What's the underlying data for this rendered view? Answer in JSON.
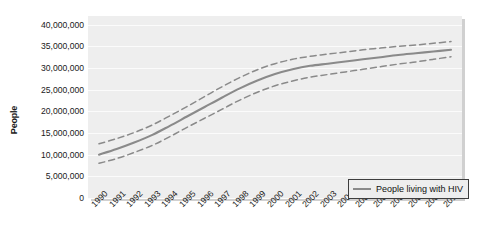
{
  "chart_data": {
    "type": "line",
    "title": "",
    "xlabel": "",
    "ylabel": "People",
    "grid": true,
    "legend_position": "bottom-right",
    "ylim": [
      0,
      42000000
    ],
    "yticks": [
      0,
      5000000,
      10000000,
      15000000,
      20000000,
      25000000,
      30000000,
      35000000,
      40000000
    ],
    "ytick_labels": [
      "0",
      "5,000,000",
      "10,000,000",
      "15,000,000",
      "20,000,000",
      "25,000,000",
      "30,000,000",
      "35,000,000",
      "40,000,000"
    ],
    "categories": [
      "1990",
      "1991",
      "1992",
      "1993",
      "1994",
      "1995",
      "1996",
      "1997",
      "1998",
      "1999",
      "2000",
      "2001",
      "2002",
      "2003",
      "2004",
      "2005",
      "2006",
      "2007",
      "2008",
      "2009",
      "2010"
    ],
    "series": [
      {
        "name": "People living with HIV",
        "style": "solid",
        "color": "#8a8a8a",
        "values": [
          10000000,
          11300000,
          12800000,
          14500000,
          16600000,
          18800000,
          21000000,
          23200000,
          25300000,
          27100000,
          28600000,
          29700000,
          30500000,
          31000000,
          31500000,
          32000000,
          32500000,
          33000000,
          33400000,
          33800000,
          34200000
        ]
      },
      {
        "name": "Upper bound",
        "style": "dashed",
        "color": "#8a8a8a",
        "values": [
          12500000,
          13700000,
          15100000,
          16800000,
          18900000,
          21100000,
          23400000,
          25700000,
          27800000,
          29600000,
          31000000,
          32000000,
          32700000,
          33200000,
          33700000,
          34200000,
          34600000,
          35000000,
          35300000,
          35700000,
          36100000
        ]
      },
      {
        "name": "Lower bound",
        "style": "dashed",
        "color": "#8a8a8a",
        "values": [
          8000000,
          9100000,
          10500000,
          12100000,
          14100000,
          16300000,
          18400000,
          20500000,
          22600000,
          24400000,
          25900000,
          27000000,
          27900000,
          28500000,
          29100000,
          29700000,
          30300000,
          30900000,
          31400000,
          32000000,
          32600000
        ]
      }
    ]
  },
  "legend": {
    "label": "People living with HIV"
  },
  "axes": {
    "y_title": "People"
  }
}
